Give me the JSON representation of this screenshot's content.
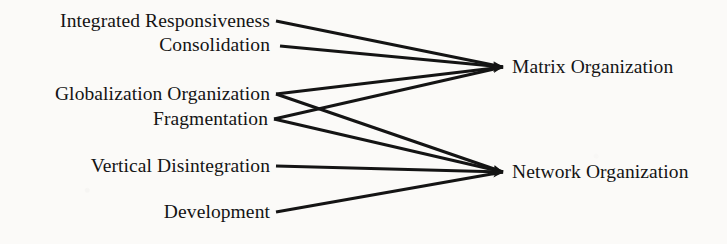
{
  "figure": {
    "background_color": "#fbfaf8",
    "ink_color": "#141414",
    "width": 727,
    "height": 244
  },
  "chart_data": {
    "type": "diagram",
    "subtype": "many-to-two convergence flow diagram",
    "title": "",
    "orientation": "left-to-right",
    "source_nodes": [
      {
        "id": "integrated_responsiveness",
        "label": "Integrated Responsiveness",
        "x": 270,
        "y": 21
      },
      {
        "id": "consolidation",
        "label": "Consolidation",
        "x": 270,
        "y": 45
      },
      {
        "id": "globalization_organization",
        "label": "Globalization Organization",
        "x": 270,
        "y": 94
      },
      {
        "id": "fragmentation",
        "label": "Fragmentation",
        "x": 270,
        "y": 119
      },
      {
        "id": "vertical_disintegration",
        "label": "Vertical Disintegration",
        "x": 270,
        "y": 166
      },
      {
        "id": "development",
        "label": "Development",
        "x": 270,
        "y": 212
      }
    ],
    "target_nodes": [
      {
        "id": "matrix_organization",
        "label": "Matrix Organization",
        "x": 512,
        "y": 67
      },
      {
        "id": "network_organization",
        "label": "Network Organization",
        "x": 512,
        "y": 172
      }
    ],
    "edges": [
      {
        "from": "integrated_responsiveness",
        "to": "matrix_organization",
        "x1": 276,
        "y1": 21,
        "x2": 503,
        "y2": 67,
        "arrow": true
      },
      {
        "from": "consolidation",
        "to": "matrix_organization",
        "x1": 280,
        "y1": 46,
        "x2": 503,
        "y2": 67,
        "arrow": true
      },
      {
        "from": "globalization_organization",
        "to": "matrix_organization",
        "x1": 276,
        "y1": 94,
        "x2": 503,
        "y2": 67,
        "arrow": true
      },
      {
        "from": "fragmentation",
        "to": "matrix_organization",
        "x1": 274,
        "y1": 119,
        "x2": 503,
        "y2": 67,
        "arrow": true
      },
      {
        "from": "globalization_organization",
        "to": "network_organization",
        "x1": 276,
        "y1": 94,
        "x2": 503,
        "y2": 172,
        "arrow": true
      },
      {
        "from": "fragmentation",
        "to": "network_organization",
        "x1": 274,
        "y1": 119,
        "x2": 503,
        "y2": 172,
        "arrow": true
      },
      {
        "from": "vertical_disintegration",
        "to": "network_organization",
        "x1": 276,
        "y1": 166,
        "x2": 503,
        "y2": 172,
        "arrow": true
      },
      {
        "from": "development",
        "to": "network_organization",
        "x1": 276,
        "y1": 212,
        "x2": 503,
        "y2": 172,
        "arrow": true
      }
    ],
    "legend": [],
    "annotations": []
  }
}
